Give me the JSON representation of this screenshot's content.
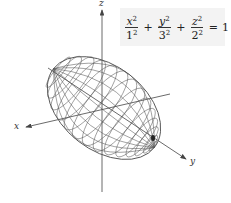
{
  "figure": {
    "equation": {
      "terms": [
        {
          "numerator": "x",
          "numerator_exp": "2",
          "denominator": "1",
          "denominator_exp": "2"
        },
        {
          "numerator": "y",
          "numerator_exp": "2",
          "denominator": "3",
          "denominator_exp": "2"
        },
        {
          "numerator": "z",
          "numerator_exp": "2",
          "denominator": "2",
          "denominator_exp": "2"
        }
      ],
      "plus": "+",
      "equals": "=",
      "rhs": "1",
      "background": "#f3f3f3"
    },
    "axes": {
      "x_label": "x",
      "y_label": "y",
      "z_label": "z"
    },
    "colors": {
      "mesh": "#555555",
      "axis": "#444444"
    }
  }
}
